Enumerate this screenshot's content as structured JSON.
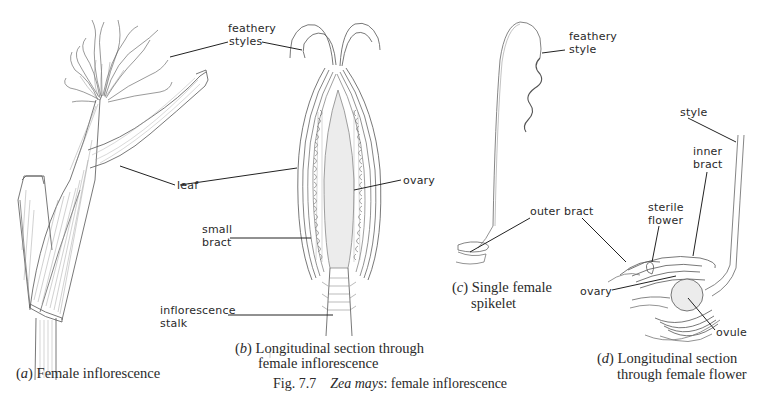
{
  "figure": {
    "number": "Fig. 7.7",
    "title_italic": "Zea mays",
    "title_rest": ": female inflorescence"
  },
  "panels": {
    "a": {
      "letter": "a",
      "caption": "Female inflorescence",
      "labels": {
        "feathery_styles_1": "feathery",
        "feathery_styles_2": "styles",
        "leaf": "leaf"
      }
    },
    "b": {
      "letter": "b",
      "caption_line1": "Longitudinal section through",
      "caption_line2": "female inflorescence",
      "labels": {
        "ovary": "ovary",
        "small_bract_1": "small",
        "small_bract_2": "bract",
        "inflorescence_stalk_1": "inflorescence",
        "inflorescence_stalk_2": "stalk"
      }
    },
    "c": {
      "letter": "c",
      "caption_line1": "Single female",
      "caption_line2": "spikelet",
      "labels": {
        "feathery_style_1": "feathery",
        "feathery_style_2": "style",
        "outer_bract": "outer bract"
      }
    },
    "d": {
      "letter": "d",
      "caption_line1": "Longitudinal section",
      "caption_line2": "through female flower",
      "labels": {
        "style": "style",
        "inner_bract_1": "inner",
        "inner_bract_2": "bract",
        "sterile_flower_1": "sterile",
        "sterile_flower_2": "flower",
        "ovary": "ovary",
        "ovule": "ovule"
      }
    }
  },
  "colors": {
    "ink": "#2a2a2a",
    "line": "#333333",
    "stipple": "#e8e8e8"
  }
}
